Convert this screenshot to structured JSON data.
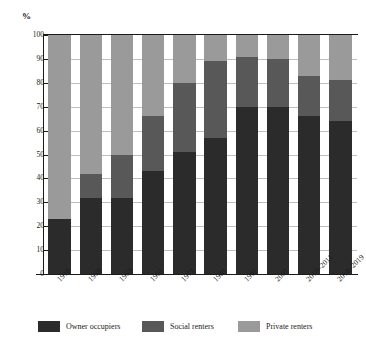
{
  "chart_data": {
    "type": "bar",
    "subtype": "stacked-bar-100",
    "title": "",
    "xlabel": "",
    "ylabel": "%",
    "ylim": [
      0,
      100
    ],
    "ytick_step": 10,
    "yticks": [
      0,
      10,
      20,
      30,
      40,
      50,
      60,
      70,
      80,
      90,
      100
    ],
    "ytick_labels": [
      "0",
      "10",
      "20",
      "30",
      "40",
      "50",
      "60",
      "70",
      "80",
      "90",
      "100"
    ],
    "grid": true,
    "grid_axis": "y",
    "legend_position": "bottom",
    "categories": [
      "1918",
      "1939",
      "1953",
      "1961",
      "1971",
      "1981",
      "1991",
      "2001",
      "2010–2011",
      "2018–2019"
    ],
    "series": [
      {
        "name": "Owner occupiers",
        "color": "#2b2b2b",
        "values": [
          23,
          32,
          32,
          43,
          51,
          57,
          70,
          70,
          66,
          64
        ]
      },
      {
        "name": "Social renters",
        "color": "#585858",
        "values": [
          0,
          10,
          18,
          23,
          29,
          32,
          21,
          20,
          17,
          17
        ]
      },
      {
        "name": "Private renters",
        "color": "#9a9a9a",
        "values": [
          77,
          58,
          50,
          34,
          20,
          11,
          9,
          10,
          17,
          19
        ]
      }
    ],
    "cumulative_tops": {
      "owner_occupiers": [
        23,
        32,
        32,
        43,
        51,
        57,
        70,
        70,
        66,
        64
      ],
      "plus_social_renters": [
        23,
        42,
        50,
        66,
        80,
        89,
        91,
        90,
        83,
        81
      ],
      "total": [
        100,
        100,
        100,
        100,
        100,
        100,
        100,
        100,
        100,
        100
      ]
    }
  },
  "axis": {
    "unit_label": "%"
  },
  "legend": {
    "items": [
      {
        "label": "Owner occupiers"
      },
      {
        "label": "Social renters"
      },
      {
        "label": "Private renters"
      }
    ]
  }
}
